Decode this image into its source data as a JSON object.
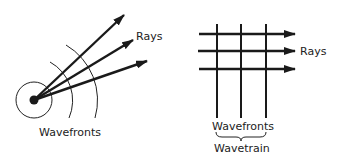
{
  "left_diagram": {
    "description": "Point source with spherical wavefronts",
    "rays_label": "Rays",
    "wavefronts_label": "Wavefronts"
  },
  "right_diagram": {
    "description": "Plane wavefronts with parallel rays",
    "rays_label": "Rays",
    "wavefronts_label": "Wavefronts",
    "wavetrain_label": "Wavetrain"
  },
  "colors": {
    "ink": "#1a1a1a",
    "background": "#ffffff"
  }
}
